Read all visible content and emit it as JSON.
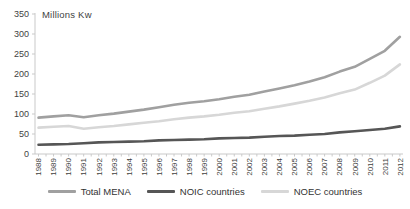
{
  "chart_data": {
    "type": "line",
    "title": "",
    "units_label": "Millions Kw",
    "categories": [
      "1988",
      "1989",
      "1990",
      "1991",
      "1992",
      "1993",
      "1994",
      "1995",
      "1996",
      "1997",
      "1998",
      "1999",
      "2000",
      "2001",
      "2002",
      "2003",
      "2004",
      "2005",
      "2006",
      "2007",
      "2008",
      "2009",
      "2010",
      "2011",
      "2012"
    ],
    "series": [
      {
        "name": "Total MENA",
        "color": "#a0a0a0",
        "values": [
          91,
          94,
          97,
          92,
          97,
          101,
          106,
          111,
          117,
          123,
          128,
          132,
          137,
          143,
          148,
          156,
          164,
          172,
          181,
          192,
          206,
          218,
          238,
          258,
          293
        ]
      },
      {
        "name": "NOIC countries",
        "color": "#565656",
        "values": [
          23,
          24,
          25,
          27,
          29,
          30,
          31,
          32,
          34,
          35,
          36,
          37,
          39,
          40,
          41,
          43,
          45,
          46,
          48,
          50,
          54,
          57,
          60,
          63,
          69
        ]
      },
      {
        "name": "NOEC countries",
        "color": "#d7d7d7",
        "values": [
          66,
          68,
          70,
          63,
          67,
          70,
          74,
          78,
          82,
          87,
          91,
          94,
          98,
          103,
          107,
          113,
          119,
          126,
          133,
          141,
          152,
          161,
          178,
          196,
          224
        ]
      }
    ],
    "legend_order": [
      0,
      1,
      2
    ],
    "ylim": [
      0,
      350
    ],
    "yticks": [
      0,
      50,
      100,
      150,
      200,
      250,
      300,
      350
    ],
    "xlabel": "",
    "ylabel": "",
    "grid": false,
    "legend_position": "bottom"
  },
  "colors": {
    "axis": "#c9c9c9",
    "tick": "#c9c9c9",
    "text": "#3f3f3f",
    "background": "#ffffff"
  }
}
